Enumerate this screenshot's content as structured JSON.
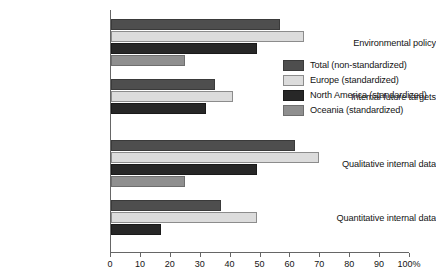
{
  "chart_data": {
    "type": "bar",
    "orientation": "horizontal",
    "title": "",
    "xlabel": "",
    "ylabel": "",
    "xlim": [
      0,
      100
    ],
    "xticks": [
      0,
      10,
      20,
      30,
      40,
      50,
      60,
      70,
      80,
      90,
      100
    ],
    "xtick_labels": [
      "0",
      "10",
      "20",
      "30",
      "40",
      "50",
      "60",
      "70",
      "80",
      "90",
      "100%"
    ],
    "grid": false,
    "legend_position": "center-right",
    "categories": [
      "Environmental policy",
      "Internal future targets",
      "Qualitative internal data",
      "Quantitative internal data"
    ],
    "series": [
      {
        "name": "Total (non-standardized)",
        "color": "#4e4e4e",
        "values": [
          57,
          35,
          62,
          37
        ]
      },
      {
        "name": "Europe (standardized)",
        "color": "#dcdcdc",
        "values": [
          65,
          41,
          70,
          49
        ]
      },
      {
        "name": "North America (standardized)",
        "color": "#272727",
        "values": [
          49,
          32,
          49,
          17
        ]
      },
      {
        "name": "Oceania (standardized)",
        "color": "#8f8f8f",
        "values": [
          25,
          null,
          25,
          null
        ]
      }
    ]
  },
  "legend": {
    "items": [
      {
        "label": "Total (non-standardized)",
        "color": "#4e4e4e"
      },
      {
        "label": "Europe (standardized)",
        "color": "#dcdcdc"
      },
      {
        "label": "North America (standardized)",
        "color": "#272727"
      },
      {
        "label": "Oceania (standardized)",
        "color": "#8f8f8f"
      }
    ]
  },
  "axis": {
    "axis_color": "#666666",
    "text_color": "#141414"
  }
}
